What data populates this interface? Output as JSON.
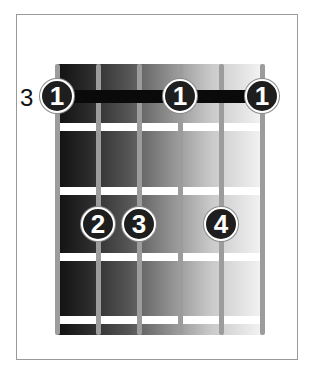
{
  "diagram": {
    "type": "guitar-chord-diagram",
    "start_fret_label": "3",
    "colors": {
      "dot": "#1e1e1e",
      "barre": "#0a0a0a",
      "string": "#9c9c9c",
      "fret": "#ffffff",
      "border": "#9a9a9a"
    },
    "strings_x": [
      57,
      98,
      139,
      180,
      221,
      262
    ],
    "frets_y": [
      127,
      191,
      257,
      320
    ],
    "barre": {
      "finger": "1",
      "from_string": 1,
      "to_string": 6,
      "fret": 1
    },
    "dots": [
      {
        "finger": "1",
        "string": 1,
        "fret": 1,
        "x": 57,
        "y": 96
      },
      {
        "finger": "1",
        "string": 4,
        "fret": 1,
        "x": 180,
        "y": 96
      },
      {
        "finger": "1",
        "string": 6,
        "fret": 1,
        "x": 262,
        "y": 96
      },
      {
        "finger": "2",
        "string": 2,
        "fret": 3,
        "x": 98,
        "y": 224
      },
      {
        "finger": "3",
        "string": 3,
        "fret": 3,
        "x": 139,
        "y": 224
      },
      {
        "finger": "4",
        "string": 5,
        "fret": 3,
        "x": 221,
        "y": 224
      }
    ]
  }
}
